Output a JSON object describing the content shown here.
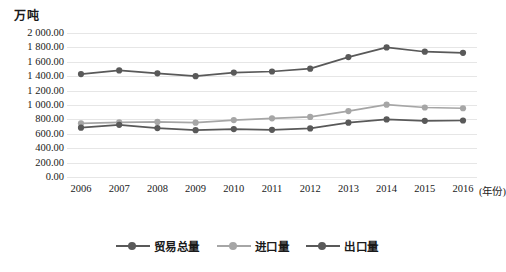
{
  "chart_data": {
    "type": "line",
    "title": "",
    "subtitle": "",
    "xlabel": "年份",
    "ylabel": "万吨",
    "x": [
      2006,
      2007,
      2008,
      2009,
      2010,
      2011,
      2012,
      2013,
      2014,
      2015,
      2016
    ],
    "categories": [
      "2006",
      "2007",
      "2008",
      "2009",
      "2010",
      "2011",
      "2012",
      "2013",
      "2014",
      "2015",
      "2016"
    ],
    "ylim": [
      0,
      2000
    ],
    "ytick_values": [
      2000,
      1800,
      1600,
      1400,
      1200,
      1000,
      800,
      600,
      400,
      200,
      0
    ],
    "ytick_labels": [
      "2 000.00",
      "1 800.00",
      "1 600.00",
      "1 400.00",
      "1 200.00",
      "1 000.00",
      "800.00",
      "600.00",
      "400.00",
      "200.00",
      "0.00"
    ],
    "grid": true,
    "legend_position": "bottom",
    "series": [
      {
        "name": "贸易总量",
        "color": "#595959",
        "marker": "circle",
        "values": [
          1430,
          1480,
          1440,
          1400,
          1450,
          1465,
          1505,
          1665,
          1800,
          1740,
          1725
        ]
      },
      {
        "name": "进口量",
        "color": "#a6a6a6",
        "marker": "circle",
        "values": [
          745,
          760,
          765,
          755,
          790,
          815,
          835,
          915,
          1005,
          965,
          955
        ]
      },
      {
        "name": "出口量",
        "color": "#595959",
        "marker": "circle",
        "values": [
          685,
          725,
          680,
          650,
          665,
          655,
          675,
          755,
          800,
          780,
          785
        ]
      }
    ]
  },
  "axis": {
    "unit_label": "万吨",
    "x_unit_label": "(年份)"
  },
  "legend": {
    "items": [
      {
        "label": "贸易总量"
      },
      {
        "label": "进口量"
      },
      {
        "label": "出口量"
      }
    ]
  },
  "colors": {
    "series_dark": "#595959",
    "series_light": "#a6a6a6",
    "gridline": "#e6e6e6",
    "text": "#1a1a1a",
    "background": "#ffffff"
  }
}
